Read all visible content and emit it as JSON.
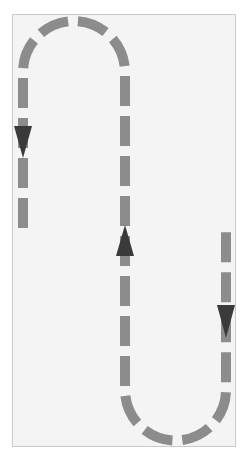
{
  "diagram": {
    "type": "serpentine-path",
    "description": "Dashed serpentine route with direction arrows",
    "colors": {
      "background": "#f4f4f4",
      "frame_border": "#c9c9c9",
      "dash": "#8c8c8c",
      "arrow": "#3a3a3a"
    },
    "segments": [
      {
        "id": "left-line",
        "direction": "down",
        "x": 23,
        "y_start": 72,
        "y_end": 228
      },
      {
        "id": "top-arc",
        "from_x": 23,
        "to_x": 125,
        "center_y": 72,
        "radius": 51
      },
      {
        "id": "middle-line",
        "direction": "up",
        "x": 125,
        "y_start": 72,
        "y_end": 390
      },
      {
        "id": "bottom-arc",
        "from_x": 125,
        "to_x": 226,
        "center_y": 390,
        "radius": 50.5
      },
      {
        "id": "right-line",
        "direction": "down",
        "x": 226,
        "y_start": 228,
        "y_end": 390
      }
    ],
    "arrows": [
      {
        "id": "arrow-left",
        "direction": "down",
        "x": 23,
        "y": 142
      },
      {
        "id": "arrow-middle",
        "direction": "up",
        "x": 125,
        "y": 242
      },
      {
        "id": "arrow-right",
        "direction": "down",
        "x": 226,
        "y": 320
      }
    ]
  }
}
